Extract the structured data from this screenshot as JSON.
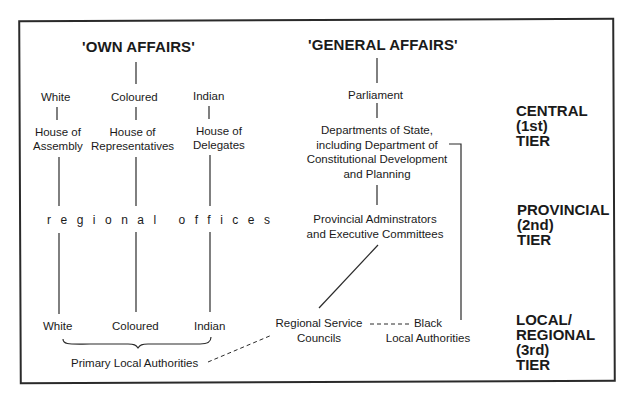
{
  "diagram": {
    "own_affairs": {
      "title": "'OWN AFFAIRS'",
      "groups": [
        {
          "label": "White",
          "house": "House of\nAssembly",
          "local": "White"
        },
        {
          "label": "Coloured",
          "house": "House of\nRepresentatives",
          "local": "Coloured"
        },
        {
          "label": "Indian",
          "house": "House of\nDelegates",
          "local": "Indian"
        }
      ],
      "regional_offices": "regional offices",
      "primary_local": "Primary Local Authorities"
    },
    "general_affairs": {
      "title": "'GENERAL AFFAIRS'",
      "parliament": "Parliament",
      "departments": "Departments of State,\nincluding Department of\nConstitutional Development\nand Planning",
      "provincial": "Provincial Adminstrators\nand Executive Committees",
      "regional_service": "Regional Service\nCouncils",
      "black_local": "Black\nLocal Authorities"
    },
    "tiers": [
      {
        "label": "CENTRAL\n(1st)\nTIER"
      },
      {
        "label": "PROVINCIAL\n(2nd)\nTIER"
      },
      {
        "label": "LOCAL/\nREGIONAL\n(3rd)\nTIER"
      }
    ],
    "colors": {
      "line": "#2a2a2a",
      "text": "#1a1a1a",
      "background": "#ffffff"
    }
  }
}
